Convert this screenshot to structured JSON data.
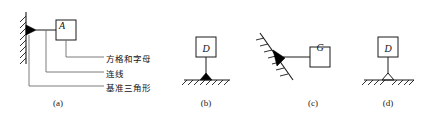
{
  "figure": {
    "title_caption_a": "(a)",
    "title_caption_b": "(b)",
    "title_caption_c": "(c)",
    "title_caption_d": "(d)",
    "line_color": "#1a1a1a",
    "fill_color": "#000000",
    "background": "#ffffff"
  },
  "panel_a": {
    "caption": "(a)",
    "datum_letter": "A",
    "callouts": [
      {
        "id": "box-and-letter",
        "label": "方格和字母"
      },
      {
        "id": "connecting-line",
        "label": "连线"
      },
      {
        "id": "datum-triangle",
        "label": "基准三角形"
      }
    ]
  },
  "panel_b": {
    "caption": "(b)",
    "datum_letter": "D",
    "triangle_style": "filled"
  },
  "panel_c": {
    "caption": "(c)",
    "datum_letter": "G",
    "triangle_style": "filled"
  },
  "panel_d": {
    "caption": "(d)",
    "datum_letter": "D",
    "triangle_style": "hollow"
  }
}
